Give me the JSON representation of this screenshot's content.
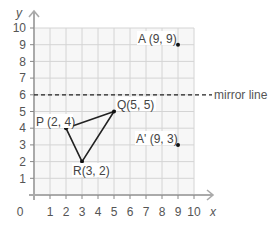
{
  "diagram": {
    "axes": {
      "x_label": "x",
      "y_label": "y",
      "origin_label": "0",
      "x_ticks": [
        "1",
        "2",
        "3",
        "4",
        "5",
        "6",
        "7",
        "8",
        "9",
        "10"
      ],
      "y_ticks": [
        "1",
        "2",
        "3",
        "4",
        "5",
        "6",
        "7",
        "8",
        "9",
        "10"
      ]
    },
    "mirror_line": {
      "y": 6,
      "label": "mirror line"
    },
    "points": {
      "A": {
        "label": "A (9, 9)",
        "x": 9,
        "y": 9
      },
      "A_prime": {
        "label": "A' (9, 3)",
        "x": 9,
        "y": 3
      },
      "P": {
        "label": "P (2, 4)",
        "x": 2,
        "y": 4
      },
      "Q": {
        "label": "Q(5, 5)",
        "x": 5,
        "y": 5
      },
      "R": {
        "label": "R(3, 2)",
        "x": 3,
        "y": 2
      }
    },
    "colors": {
      "grid": "#d0d0d0",
      "axis": "#aaaaaa",
      "plot_bg": "#f7f7f7",
      "ink": "#222222"
    }
  }
}
